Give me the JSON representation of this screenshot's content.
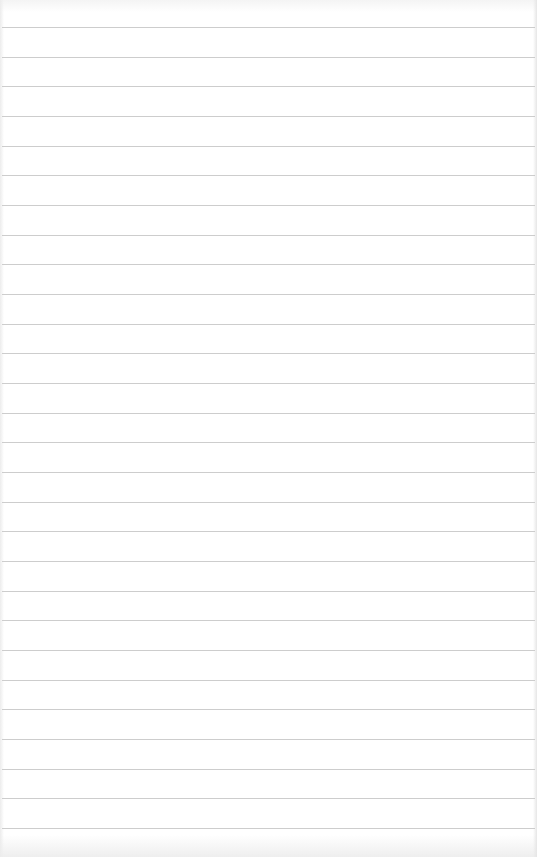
{
  "paper": {
    "type": "lined-paper",
    "background_color": "#ffffff",
    "line_color": "#c8c8c8",
    "line_count": 28,
    "first_line_y": 27,
    "line_spacing": 29.66
  }
}
